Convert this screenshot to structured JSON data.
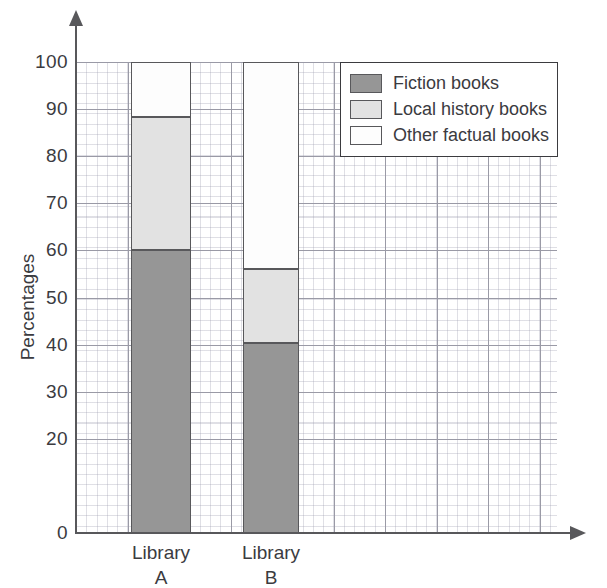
{
  "chart_data": {
    "type": "bar",
    "subtype": "stacked-bar-100-percent",
    "title": "",
    "xlabel": "",
    "ylabel": "Percentages",
    "categories": [
      "Library\nA",
      "Library\nB"
    ],
    "category_labels": [
      {
        "line1": "Library",
        "line2": "A"
      },
      {
        "line1": "Library",
        "line2": "B"
      }
    ],
    "series": [
      {
        "name": "Fiction books",
        "values": [
          60.0,
          40.3
        ],
        "color": "#969696"
      },
      {
        "name": "Local history books",
        "values": [
          28.3,
          15.8
        ],
        "color": "#e2e2e2"
      },
      {
        "name": "Other factual books",
        "values": [
          11.7,
          43.9
        ],
        "color": "#fdfdfd"
      }
    ],
    "cumulative_tops": [
      [
        60.0,
        88.3,
        100.0
      ],
      [
        40.3,
        56.1,
        100.0
      ]
    ],
    "ylim": [
      0,
      100
    ],
    "yticks": [
      0,
      20,
      30,
      40,
      50,
      60,
      70,
      80,
      90,
      100
    ],
    "ytick_labels": [
      "0",
      "20",
      "30",
      "40",
      "50",
      "60",
      "70",
      "80",
      "90",
      "100"
    ],
    "grid": true,
    "grid_minor": true,
    "legend_position": "top-right",
    "legend_entries": [
      "Fiction books",
      "Local history books",
      "Other factual books"
    ]
  },
  "axes": {
    "y_title": "Percentages",
    "y_arrow": "arrow-up",
    "x_arrow": "arrow-right"
  },
  "legend": {
    "items": [
      {
        "label": "Fiction books"
      },
      {
        "label": "Local history books"
      },
      {
        "label": "Other factual books"
      }
    ]
  },
  "colors": {
    "fiction": "#969696",
    "local_history": "#e2e2e2",
    "other_factual": "#fdfdfd",
    "axis": "#58585b",
    "grid_major": "#9a9aa6",
    "text": "#3b3b3f"
  }
}
